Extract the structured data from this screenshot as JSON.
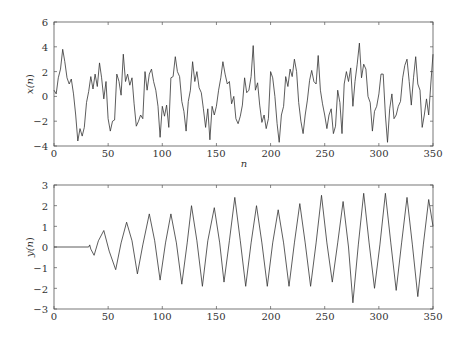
{
  "chart_data": [
    {
      "type": "line",
      "title": "",
      "xlabel": "n",
      "ylabel": "x(n)",
      "xlim": [
        0,
        350
      ],
      "ylim": [
        -4,
        6
      ],
      "xticks": [
        0,
        50,
        100,
        150,
        200,
        250,
        300,
        350
      ],
      "yticks": [
        -4,
        -2,
        0,
        2,
        4,
        6
      ],
      "grid": false,
      "legend": null,
      "series": [
        {
          "name": "x(n)",
          "color": "#333333",
          "x": [
            0,
            2,
            4,
            6,
            8,
            10,
            12,
            14,
            16,
            18,
            20,
            22,
            24,
            26,
            28,
            30,
            32,
            34,
            36,
            38,
            40,
            42,
            44,
            46,
            48,
            50,
            52,
            54,
            56,
            58,
            60,
            62,
            64,
            66,
            68,
            70,
            72,
            74,
            76,
            78,
            80,
            82,
            84,
            86,
            88,
            90,
            92,
            94,
            96,
            98,
            100,
            102,
            104,
            106,
            108,
            110,
            112,
            114,
            116,
            118,
            120,
            122,
            124,
            126,
            128,
            130,
            132,
            134,
            136,
            138,
            140,
            142,
            144,
            146,
            148,
            150,
            152,
            154,
            156,
            158,
            160,
            162,
            164,
            166,
            168,
            170,
            172,
            174,
            176,
            178,
            180,
            182,
            184,
            186,
            188,
            190,
            192,
            194,
            196,
            198,
            200,
            202,
            204,
            206,
            208,
            210,
            212,
            214,
            216,
            218,
            220,
            222,
            224,
            226,
            228,
            230,
            232,
            234,
            236,
            238,
            240,
            242,
            244,
            246,
            248,
            250,
            252,
            254,
            256,
            258,
            260,
            262,
            264,
            266,
            268,
            270,
            272,
            274,
            276,
            278,
            280,
            282,
            284,
            286,
            288,
            290,
            292,
            294,
            296,
            298,
            300,
            302,
            304,
            306,
            308,
            310,
            312,
            314,
            316,
            318,
            320,
            322,
            324,
            326,
            328,
            330,
            332,
            334,
            336,
            338,
            340,
            342,
            344,
            346,
            348,
            350
          ],
          "values": [
            0.5,
            0.2,
            1.5,
            2.2,
            3.8,
            2.8,
            1.5,
            1.0,
            1.4,
            0.2,
            -1.5,
            -3.6,
            -2.6,
            -3.2,
            -2.5,
            -0.5,
            0.4,
            1.6,
            0.6,
            1.8,
            0.8,
            2.7,
            1.5,
            -0.2,
            1.2,
            -1.8,
            -2.8,
            -2.0,
            -1.9,
            1.8,
            1.2,
            0.1,
            3.4,
            1.2,
            1.8,
            0.9,
            1.5,
            -0.6,
            -2.4,
            -2.0,
            -1.5,
            -1.8,
            2.0,
            0.5,
            1.8,
            2.2,
            1.2,
            0.5,
            -0.8,
            -3.3,
            -0.8,
            -1.6,
            -0.7,
            -2.5,
            1.5,
            1.6,
            3.2,
            2.0,
            1.6,
            -0.4,
            -1.2,
            -2.8,
            -0.4,
            0.5,
            2.8,
            1.2,
            2.0,
            0.7,
            0.3,
            -1.0,
            -2.5,
            -1.0,
            -3.5,
            -0.8,
            -1.5,
            -0.8,
            0.5,
            1.5,
            2.8,
            1.8,
            1.0,
            1.2,
            -0.6,
            0.0,
            -1.8,
            -2.2,
            -1.6,
            -0.7,
            1.5,
            0.3,
            0.5,
            1.6,
            4.1,
            0.5,
            1.1,
            -0.7,
            -2.1,
            -1.5,
            -2.6,
            -1.8,
            2.0,
            1.5,
            0.0,
            -2.2,
            -3.7,
            -1.5,
            -0.8,
            1.6,
            0.8,
            2.2,
            1.6,
            3.0,
            2.0,
            -0.5,
            -2.0,
            -3.0,
            -1.5,
            -0.3,
            1.3,
            2.1,
            1.2,
            1.0,
            3.3,
            0.5,
            -0.6,
            -1.5,
            -2.6,
            -1.5,
            -1.0,
            -3.0,
            -2.4,
            0.5,
            -0.5,
            -3.0,
            1.0,
            2.0,
            1.2,
            2.3,
            -0.8,
            1.2,
            2.6,
            4.3,
            1.5,
            2.6,
            2.2,
            0.0,
            -0.5,
            -2.8,
            -1.2,
            -0.8,
            0.2,
            1.8,
            1.8,
            -1.5,
            -3.7,
            -1.0,
            0.2,
            -1.8,
            -1.5,
            -0.8,
            -0.4,
            1.5,
            2.5,
            3.0,
            1.2,
            -0.7,
            1.5,
            3.2,
            1.0,
            0.5,
            -2.5,
            -1.5,
            -0.2,
            -1.5,
            1.0,
            3.4,
            1.0,
            0.3,
            -1.0,
            -3.8,
            0.5,
            -1.0,
            -2.0,
            -1.5,
            -2.5,
            -1.8,
            -0.3,
            1.5,
            3.2,
            2.2,
            0.3,
            -2.0,
            -1.0,
            2.2,
            0.0,
            -0.5,
            1.0,
            2.0,
            2.4,
            2.0,
            0.8,
            -0.8,
            -2.0,
            -1.2,
            1.0,
            -2.2,
            -0.5,
            1.8,
            2.4,
            3.3,
            1.5,
            0.1,
            1.2,
            -0.8,
            -1.2,
            -0.2,
            -2.0,
            0.3,
            1.8,
            2.0,
            0.5,
            -0.3,
            -1.2,
            -0.8,
            0.0,
            1.4,
            2.0,
            1.2,
            3.6,
            2.5,
            1.2,
            -0.5,
            -1.5,
            -1.0,
            -1.7,
            -0.2,
            0.5,
            1.5,
            0.5,
            1.6,
            1.2,
            2.5,
            0.5,
            -0.3,
            -1.5,
            -2.2,
            -1.8,
            -0.8,
            -2.4,
            -0.2,
            0.5,
            -0.7,
            1.5,
            2.0,
            3.5,
            1.8,
            3.2,
            -0.5,
            -2.5,
            -0.3,
            1.2,
            1.5,
            0.5,
            -0.2,
            -2.0,
            -1.5,
            -0.8,
            -1.2,
            -1.0,
            -2.3,
            0.3,
            2.2,
            1.3,
            2.0,
            4.5,
            1.8,
            2.8,
            1.5,
            1.0,
            -0.5,
            -0.8,
            -1.8,
            -0.2,
            1.3,
            2.5,
            0.7,
            -0.5,
            -0.5,
            -0.5,
            -0.5,
            -2.8,
            -1.2,
            -0.5,
            -1.0,
            -0.5,
            -2.3,
            -1.8,
            -2.0,
            -2.0,
            -1.2,
            1.0,
            2.3,
            -0.7,
            -0.3,
            -2.5,
            -3.6,
            -1.0,
            -1.5,
            -0.5,
            -2.5,
            -1.2,
            -2.0,
            1.0,
            2.2,
            1.5,
            3.3,
            -0.2,
            2.0,
            1.5,
            0.2,
            1.0,
            3.4,
            0.5,
            -2.0,
            -1.5,
            -1.0,
            -1.8,
            -2.5,
            -2.2,
            -3.8,
            -1.5,
            -0.5,
            -1.0,
            -0.3,
            -0.8,
            0.8,
            1.8,
            2.6,
            1.8,
            2.0,
            3.4,
            2.8,
            1.5,
            2.5,
            1.0
          ],
          "note": "approximate digitized trace; noisy signal oscillating roughly between -3.8 and 4.6"
        }
      ]
    },
    {
      "type": "line",
      "title": "",
      "xlabel": "",
      "ylabel": "y(n)",
      "xlim": [
        0,
        350
      ],
      "ylim": [
        -3,
        3
      ],
      "xticks": [
        0,
        50,
        100,
        150,
        200,
        250,
        300,
        350
      ],
      "yticks": [
        -3,
        -2,
        -1,
        0,
        1,
        2,
        3
      ],
      "grid": false,
      "legend": null,
      "series": [
        {
          "name": "y(n)",
          "color": "#333333",
          "x": [
            0,
            32,
            33,
            34,
            37,
            41,
            46,
            51,
            57,
            62,
            67,
            72,
            77,
            82,
            88,
            93,
            98,
            103,
            108,
            113,
            118,
            123,
            127,
            132,
            137,
            142,
            148,
            153,
            157,
            162,
            167,
            172,
            177,
            182,
            187,
            192,
            197,
            202,
            207,
            212,
            217,
            222,
            227,
            232,
            237,
            242,
            247,
            252,
            257,
            262,
            267,
            272,
            276,
            281,
            286,
            291,
            296,
            301,
            306,
            311,
            316,
            321,
            326,
            331,
            336,
            341,
            346,
            350
          ],
          "values": [
            0,
            0,
            0.1,
            -0.1,
            -0.4,
            0.3,
            0.8,
            -0.2,
            -1.1,
            0.2,
            1.2,
            0.3,
            -1.3,
            0.1,
            1.6,
            0.3,
            -1.6,
            0.2,
            1.6,
            0.2,
            -1.8,
            0.2,
            2.0,
            0.3,
            -1.9,
            0.3,
            1.9,
            0.2,
            -1.7,
            0.3,
            2.4,
            0.3,
            -1.9,
            0.2,
            2.0,
            0.2,
            -1.9,
            0.2,
            1.8,
            0.2,
            -1.9,
            0.2,
            2.1,
            0.2,
            -1.9,
            0.2,
            2.5,
            0.2,
            -1.7,
            0.2,
            2.2,
            0.0,
            -2.7,
            0.1,
            2.6,
            0.2,
            -2.0,
            0.1,
            2.6,
            0.2,
            -2.1,
            0.2,
            2.4,
            0.1,
            -2.4,
            0.1,
            2.3,
            1.0
          ],
          "note": "approximate digitized trace; zero until n≈33, then growing oscillation with period ≈20"
        }
      ]
    }
  ],
  "top_chart": {
    "ylabel_main": "x(",
    "ylabel_var": "n",
    "ylabel_close": ")",
    "xlabel": "n",
    "xtick_labels": [
      "0",
      "50",
      "100",
      "150",
      "200",
      "250",
      "300",
      "350"
    ],
    "ytick_labels": [
      "6",
      "4",
      "2",
      "0",
      "−2",
      "−4"
    ]
  },
  "bottom_chart": {
    "ylabel_main": "y(",
    "ylabel_var": "n",
    "ylabel_close": ")",
    "xtick_labels": [
      "0",
      "50",
      "100",
      "150",
      "200",
      "250",
      "300",
      "350"
    ],
    "ytick_labels": [
      "3",
      "2",
      "1",
      "0",
      "−1",
      "−2",
      "−3"
    ]
  }
}
